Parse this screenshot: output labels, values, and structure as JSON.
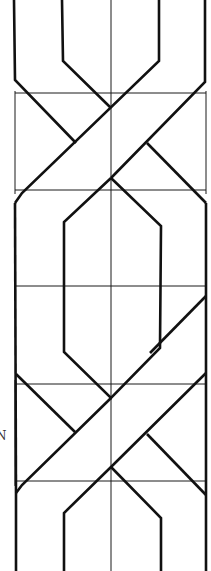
{
  "diagram": {
    "type": "braided interlace (cable twist) pattern with construction grid",
    "colors": {
      "line": "#111111",
      "background": "#ffffff"
    },
    "labels": [
      {
        "text": "N",
        "x": 0,
        "y": 438
      }
    ],
    "grid": {
      "center_x": 111,
      "left_x": 14,
      "right_x": 206,
      "horizontal_lines_y": [
        93,
        190,
        286,
        384,
        481
      ]
    }
  }
}
